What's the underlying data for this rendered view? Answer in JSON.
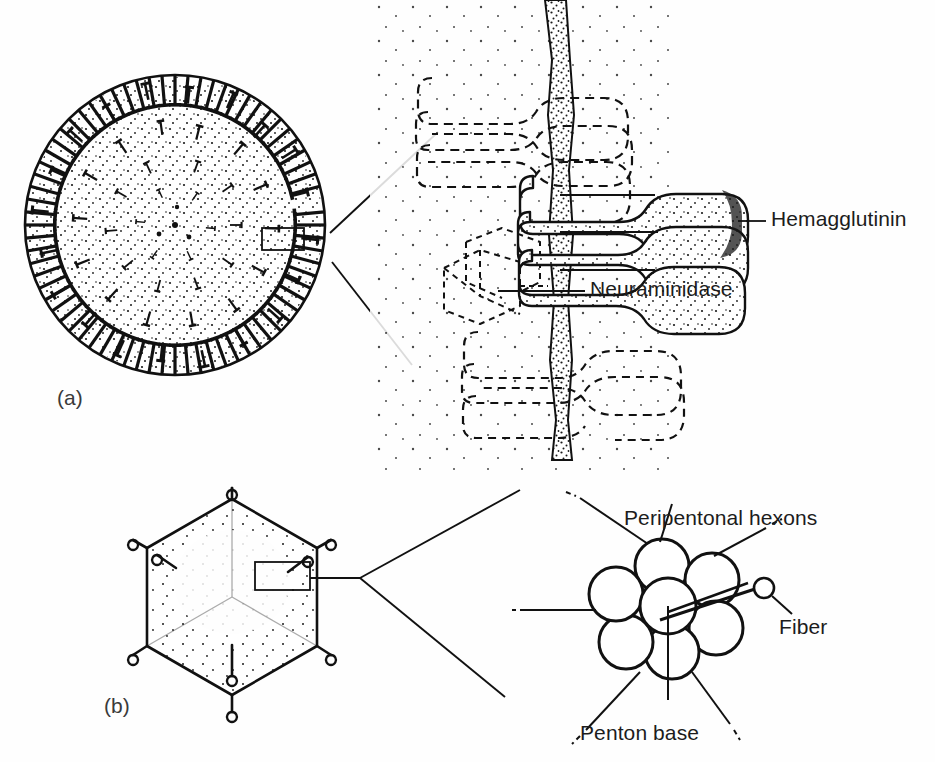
{
  "figure": {
    "background_color": "#fefefe",
    "ink_color": "#1a1a1a",
    "width": 935,
    "height": 762
  },
  "panels": [
    {
      "tag": "(a)",
      "subject": "Influenza virus (orthomyxovirus) particle with envelope glycoprotein spikes",
      "overview": {
        "shape": "circle",
        "center_x": 175,
        "center_y": 225,
        "radius": 150,
        "spike_count": 72,
        "stipple": true,
        "callout_box": {
          "x": 262,
          "y": 228,
          "width": 42,
          "height": 22
        }
      },
      "detail": {
        "membrane_x": 565,
        "spike_rows": 3,
        "solid_row_index": 1
      },
      "labels": [
        {
          "text": "Hemagglutinin",
          "x": 771,
          "y": 207,
          "leader_from_x": 755,
          "leader_from_y": 222,
          "leader_to_x": 735,
          "leader_to_y": 222
        },
        {
          "text": "Neuraminidase",
          "x": 590,
          "y": 277,
          "leader_from_x": 578,
          "leader_from_y": 292,
          "leader_to_x": 500,
          "leader_to_y": 292
        }
      ]
    },
    {
      "tag": "(b)",
      "subject": "Adenovirus icosahedral capsid with penton fibers",
      "overview": {
        "shape": "hexagon",
        "center_x": 232,
        "center_y": 597,
        "radius": 98,
        "fiber_count": 6,
        "stipple": true,
        "callout_box": {
          "x": 255,
          "y": 562,
          "width": 55,
          "height": 28
        }
      },
      "detail": {
        "center_x": 665,
        "center_y": 612,
        "hexon_radius": 27,
        "hexon_count": 7,
        "fiber_knob": {
          "x": 763,
          "y": 588,
          "r": 9
        }
      },
      "labels": [
        {
          "text": "Peripentonal hexons",
          "x": 624,
          "y": 506
        },
        {
          "text": "Fiber",
          "x": 779,
          "y": 615
        },
        {
          "text": "Penton base",
          "x": 580,
          "y": 721
        }
      ]
    }
  ],
  "panel_tags": {
    "a": "(a)",
    "b": "(b)"
  },
  "annotations": {
    "hemagglutinin": "Hemagglutinin",
    "neuraminidase": "Neuraminidase",
    "peripentonal_hexons": "Peripentonal hexons",
    "fiber": "Fiber",
    "penton_base": "Penton base"
  }
}
